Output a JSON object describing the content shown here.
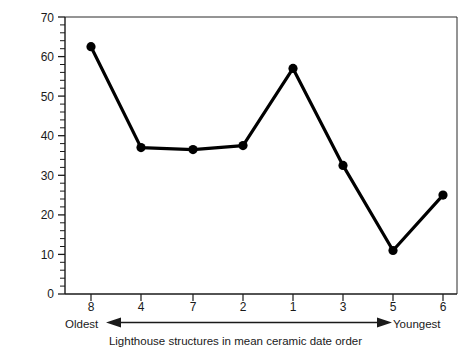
{
  "chart_data": {
    "type": "line",
    "title": "",
    "xlabel": "Lighthouse structures in mean ceramic date order",
    "ylabel": "Percentage of hollowware",
    "categories": [
      "8",
      "4",
      "7",
      "2",
      "1",
      "3",
      "5",
      "6"
    ],
    "values": [
      62.5,
      37.0,
      36.5,
      37.5,
      57.0,
      32.5,
      11.0,
      25.0
    ],
    "ylim": [
      0,
      70
    ],
    "yticks": [
      0,
      10,
      20,
      30,
      40,
      50,
      60,
      70
    ],
    "ytick_labels": [
      "0",
      "10",
      "20",
      "30",
      "40",
      "50",
      "60",
      "70"
    ],
    "y_minor_tick_step": 2,
    "grid": false,
    "legend": false,
    "marker": "filled-circle",
    "line_color": "#000000",
    "marker_color": "#000000",
    "background_color": "#ffffff"
  },
  "annotations": {
    "oldest_label": "Oldest",
    "youngest_label": "Youngest",
    "direction_arrow": "double-headed-horizontal-arrow"
  },
  "axis_title": "Lighthouse structures in mean ceramic date order"
}
